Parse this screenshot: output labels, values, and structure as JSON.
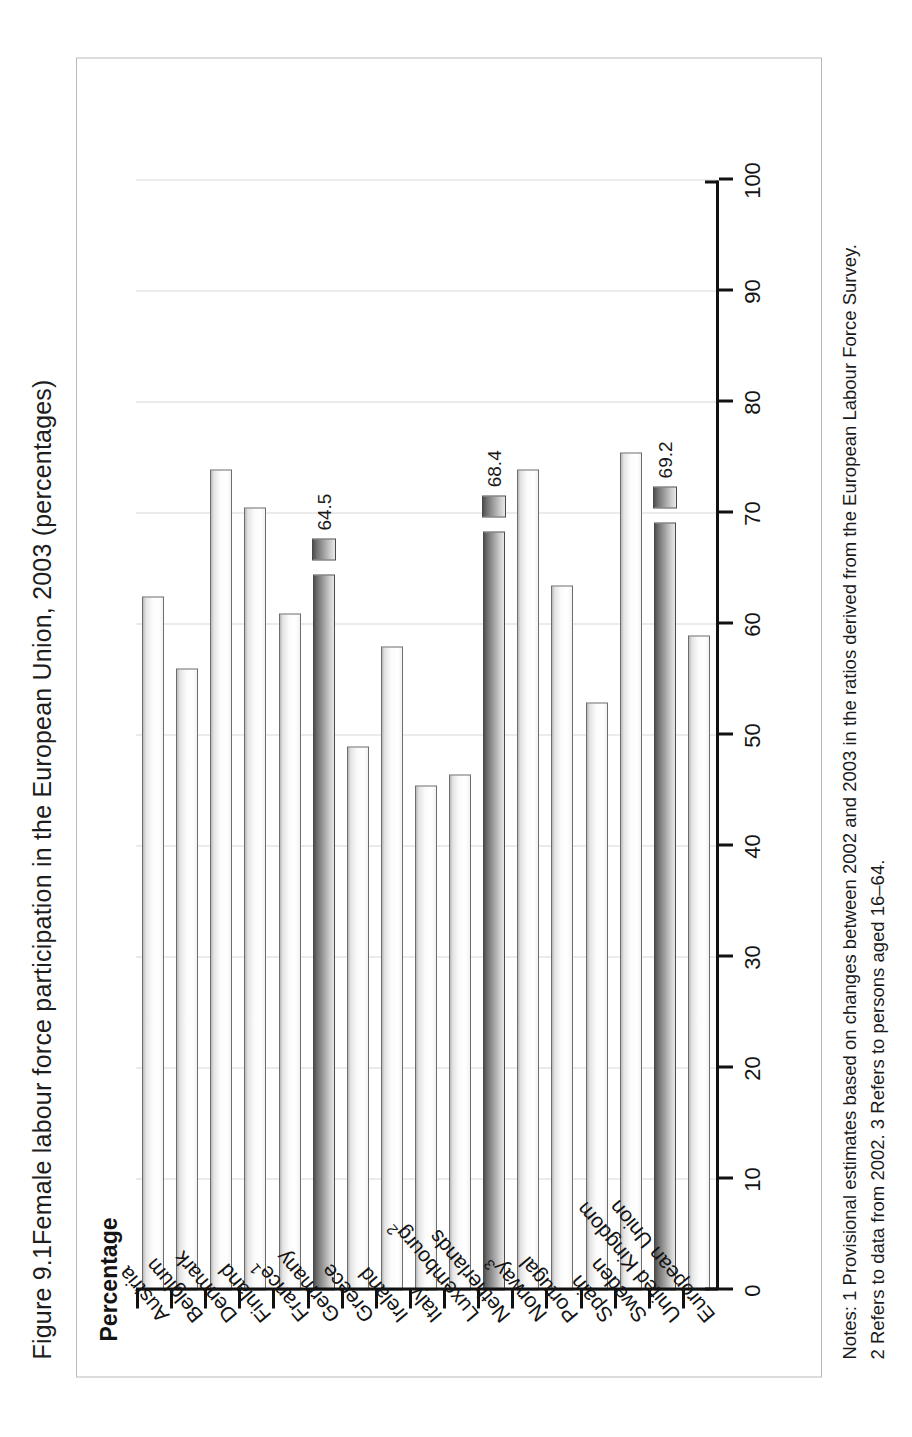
{
  "figure": {
    "number": "Figure 9.1",
    "title": "Female labour force participation in the European Union, 2003 (percentages)"
  },
  "axis": {
    "y_label": "Percentage",
    "tick_labels": [
      "0",
      "10",
      "20",
      "30",
      "40",
      "50",
      "60",
      "70",
      "80",
      "90",
      "100"
    ]
  },
  "notes": {
    "line1": "Notes: 1 Provisional estimates based on changes between 2002 and 2003 in the ratios derived from the European Labour Force Survey.",
    "line2": "2 Refers to data from 2002. 3 Refers to persons aged 16–64."
  },
  "chart_data": {
    "type": "bar",
    "title": "Female labour force participation in the European Union, 2003 (percentages)",
    "xlabel": "",
    "ylabel": "Percentage",
    "ylim": [
      0,
      100
    ],
    "grid": true,
    "orientation": "vertical",
    "categories": [
      "Austria",
      "Belgium",
      "Denmark",
      "Finland",
      "France1",
      "Germany",
      "Greece",
      "Ireland",
      "Italy",
      "Luxembourg2",
      "Netherlands",
      "Norway3",
      "Portugal",
      "Spain",
      "Sweden",
      "United Kingdom",
      "European Union"
    ],
    "category_labels": [
      "Austria",
      "Belgium",
      "Denmark",
      "Finland",
      "France",
      "Germany",
      "Greece",
      "Ireland",
      "Italy",
      "Luxembourg",
      "Netherlands",
      "Norway",
      "Portugal",
      "Spain",
      "Sweden",
      "United Kingdom",
      "European Union"
    ],
    "category_footnotes": [
      "",
      "",
      "",
      "",
      "1",
      "",
      "",
      "",
      "",
      "2",
      "",
      "3",
      "",
      "",
      "",
      "",
      ""
    ],
    "values": [
      62.5,
      56.0,
      74.0,
      70.5,
      61.0,
      64.5,
      49.0,
      58.0,
      45.5,
      46.5,
      68.4,
      74.0,
      63.5,
      53.0,
      75.5,
      69.2,
      59.0
    ],
    "highlighted": [
      false,
      false,
      false,
      false,
      false,
      true,
      false,
      false,
      false,
      false,
      true,
      false,
      false,
      false,
      false,
      true,
      false
    ],
    "data_labels": {
      "Germany": "64.5",
      "Netherlands": "68.4",
      "United Kingdom": "69.2"
    },
    "series": [
      {
        "name": "Female labour force participation rate",
        "values": [
          62.5,
          56.0,
          74.0,
          70.5,
          61.0,
          64.5,
          49.0,
          58.0,
          45.5,
          46.5,
          68.4,
          74.0,
          63.5,
          53.0,
          75.5,
          69.2,
          59.0
        ]
      }
    ],
    "colors": {
      "bar_light": "#ffffff",
      "bar_dark": "#7a7a7a",
      "outline": "#6d6d6d",
      "grid": "#d8d8d8",
      "axis": "#111111"
    }
  }
}
